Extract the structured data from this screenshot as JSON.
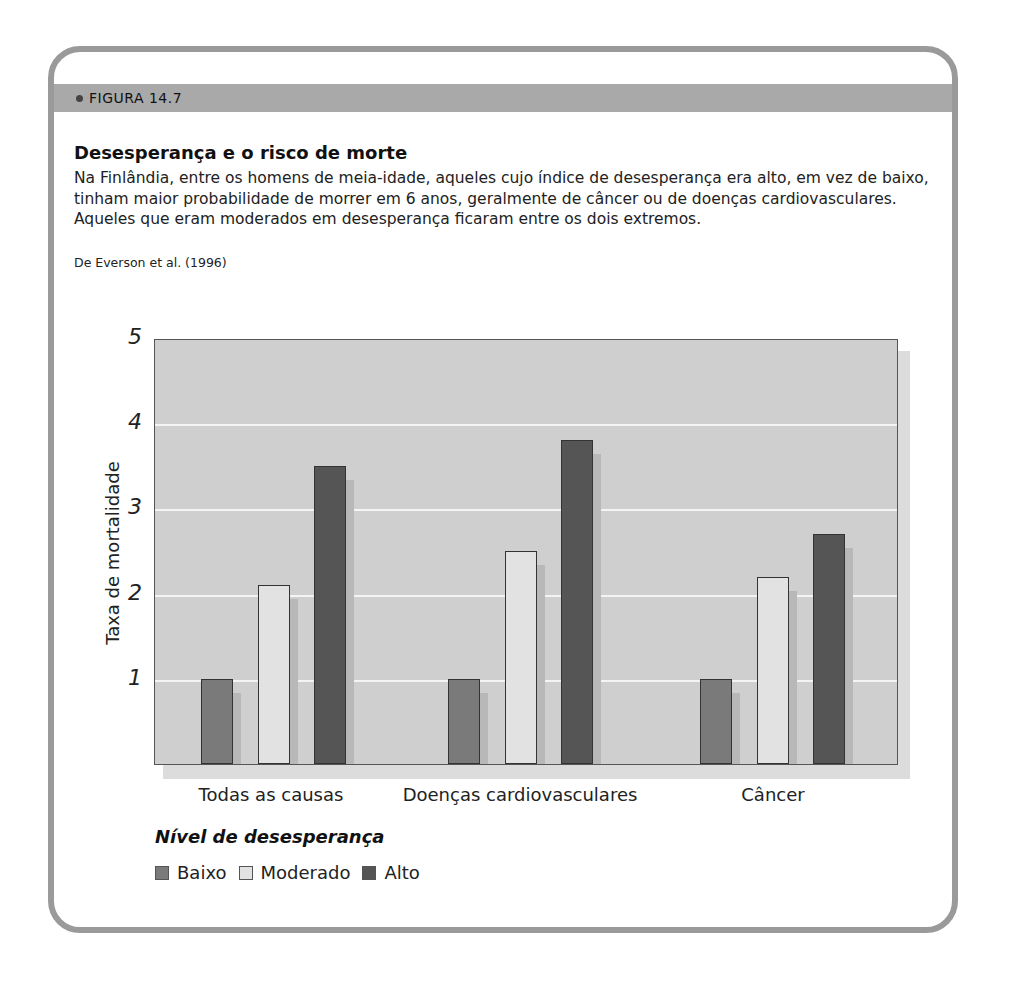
{
  "figure": {
    "label": "FIGURA 14.7",
    "title": "Desesperança e o risco de morte",
    "caption": "Na Finlândia, entre os homens de meia-idade, aqueles cujo índice de desesperança era alto, em vez de baixo, tinham maior probabilidade de morrer em 6 anos, geralmente de câncer ou de doenças cardiovasculares. Aqueles que eram moderados em desesperança ficaram entre os dois extremos.",
    "source": "De Everson et al. (1996)"
  },
  "colors": {
    "baixo": "#7a7a7a",
    "moderado": "#e2e2e2",
    "alto": "#555555",
    "plot_bg": "#cfcfcf",
    "band": "#a9a9a9",
    "border": "#9a9a9a"
  },
  "chart_data": {
    "type": "bar",
    "title": "Desesperança e o risco de morte",
    "xlabel": "",
    "ylabel": "Taxa de mortalidade",
    "ylim": [
      0,
      5
    ],
    "yticks": [
      "1",
      "2",
      "3",
      "4",
      "5"
    ],
    "grid": true,
    "legend_title": "Nível de desesperança",
    "legend_position": "bottom-left",
    "categories": [
      "Todas as causas",
      "Doenças cardiovasculares",
      "Câncer"
    ],
    "series": [
      {
        "name": "Baixo",
        "values": [
          1.0,
          1.0,
          1.0
        ]
      },
      {
        "name": "Moderado",
        "values": [
          2.1,
          2.5,
          2.2
        ]
      },
      {
        "name": "Alto",
        "values": [
          3.5,
          3.8,
          2.7
        ]
      }
    ]
  }
}
